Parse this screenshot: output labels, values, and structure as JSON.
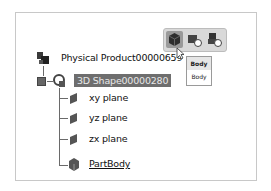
{
  "tree": {
    "root": {
      "label": "Physical Product00000659",
      "icon": "physical-product-icon"
    },
    "shape": {
      "label": "3D Shape00000280",
      "icon": "3d-shape-icon",
      "selected": true,
      "expander": "minus"
    },
    "children": [
      {
        "label": "xy plane",
        "icon": "plane-icon"
      },
      {
        "label": "yz plane",
        "icon": "plane-icon"
      },
      {
        "label": "zx plane",
        "icon": "plane-icon"
      },
      {
        "label": "PartBody",
        "icon": "body-icon",
        "underlined": true
      }
    ]
  },
  "toolbar": {
    "buttons": [
      {
        "name": "body-button",
        "icon": "body-cube-icon",
        "active": true
      },
      {
        "name": "geometrical-set-button",
        "icon": "geometrical-set-icon"
      },
      {
        "name": "ordered-geometrical-set-button",
        "icon": "ordered-geometrical-set-icon"
      }
    ]
  },
  "tooltip": {
    "title": "Body",
    "subtitle": "Body"
  },
  "colors": {
    "selection_bg": "#6e6e6e",
    "toolbar_bg": "#d9d9d9"
  }
}
